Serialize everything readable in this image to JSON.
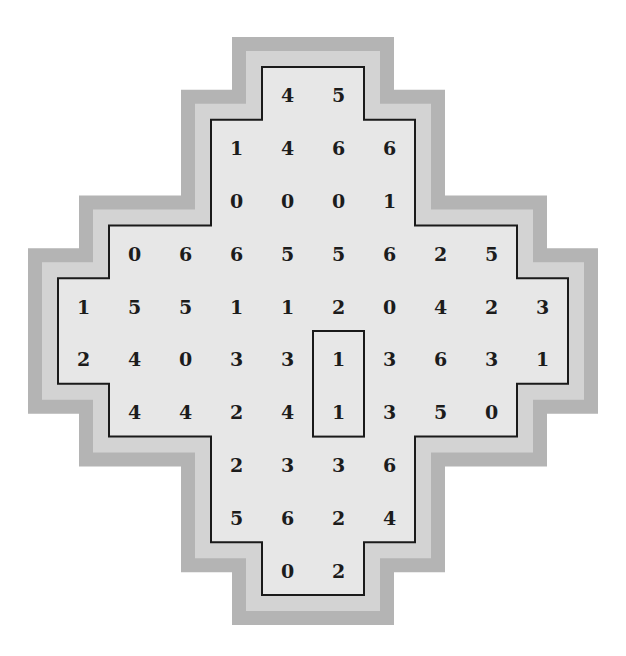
{
  "puzzle": {
    "title": "Number domino grid",
    "colors": {
      "outer_band": "#b4b4b4",
      "inner_band": "#d3d3d3",
      "fill": "#e7e7e7",
      "outline": "#1a1a1a",
      "text": "#1c1c1c"
    },
    "grid": {
      "origin_x": 58,
      "origin_y": 67,
      "cell_w": 51,
      "cell_h": 52.8,
      "rows": [
        {
          "start_col": 4,
          "values": [
            "4",
            "5"
          ]
        },
        {
          "start_col": 3,
          "values": [
            "1",
            "4",
            "6",
            "6"
          ]
        },
        {
          "start_col": 3,
          "values": [
            "0",
            "0",
            "0",
            "1"
          ]
        },
        {
          "start_col": 1,
          "values": [
            "0",
            "6",
            "6",
            "5",
            "5",
            "6",
            "2",
            "5"
          ]
        },
        {
          "start_col": 0,
          "values": [
            "1",
            "5",
            "5",
            "1",
            "1",
            "2",
            "0",
            "4",
            "2",
            "3"
          ]
        },
        {
          "start_col": 0,
          "values": [
            "2",
            "4",
            "0",
            "3",
            "3",
            "1",
            "3",
            "6",
            "3",
            "1"
          ]
        },
        {
          "start_col": 1,
          "values": [
            "4",
            "4",
            "2",
            "4",
            "1",
            "3",
            "5",
            "0"
          ]
        },
        {
          "start_col": 3,
          "values": [
            "2",
            "3",
            "3",
            "6"
          ]
        },
        {
          "start_col": 3,
          "values": [
            "5",
            "6",
            "2",
            "4"
          ]
        },
        {
          "start_col": 4,
          "values": [
            "0",
            "2"
          ]
        }
      ]
    },
    "highlight": {
      "col": 5,
      "row_start": 5,
      "row_end": 6,
      "values": [
        "1",
        "1"
      ]
    }
  }
}
